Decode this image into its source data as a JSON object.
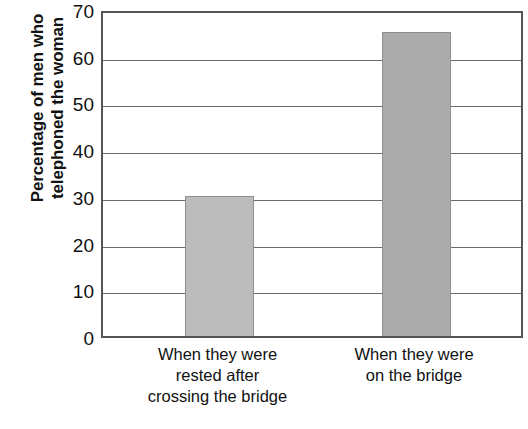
{
  "chart_data": {
    "type": "bar",
    "title": "",
    "xlabel": "",
    "ylabel": "Percentage of men who telephoned the woman",
    "ylabel_lines": [
      "Percentage of men who",
      "telephoned the woman"
    ],
    "categories": [
      "When they were rested after crossing the bridge",
      "When they were on the bridge"
    ],
    "category_lines": [
      [
        "When they were",
        "rested after",
        "crossing the bridge"
      ],
      [
        "When they were",
        "on the bridge"
      ]
    ],
    "values": [
      30,
      65
    ],
    "ylim": [
      0,
      70
    ],
    "yticks": [
      0,
      10,
      20,
      30,
      40,
      50,
      60,
      70
    ],
    "ytick_labels": [
      "0",
      "10",
      "20",
      "30",
      "40",
      "50",
      "60",
      "70"
    ],
    "grid": true,
    "legend": null,
    "bar_colors": [
      "#bcbcbc",
      "#ababab"
    ],
    "bar_border_color": "#8e8e8e",
    "axis_color": "#555555",
    "gridline_color": "#6a6a6a",
    "text_color": "#111111"
  }
}
